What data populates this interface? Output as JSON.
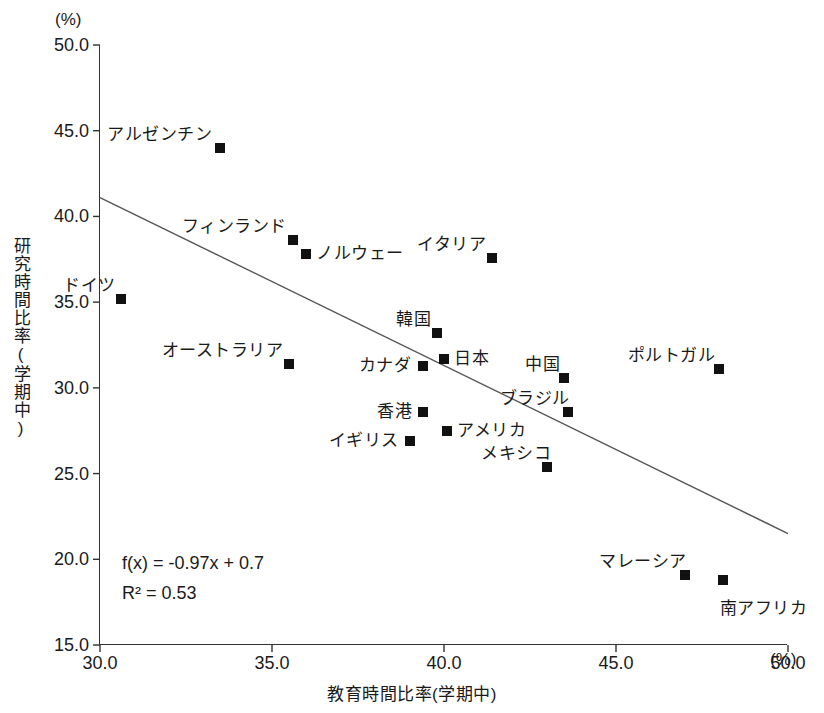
{
  "chart_data": {
    "type": "scatter",
    "title": "",
    "xlabel": "教育時間比率(学期中)",
    "ylabel": "研究時間比率(学期中)",
    "x_unit": "(%)",
    "y_unit": "(%)",
    "xlim": [
      30.0,
      50.0
    ],
    "ylim": [
      15.0,
      50.0
    ],
    "xticks": [
      "30.0",
      "35.0",
      "40.0",
      "45.0",
      "50.0"
    ],
    "xtick_values": [
      30.0,
      35.0,
      40.0,
      45.0,
      50.0
    ],
    "yticks": [
      "50.0",
      "45.0",
      "40.0",
      "35.0",
      "30.0",
      "25.0",
      "20.0",
      "15.0"
    ],
    "ytick_values": [
      50.0,
      45.0,
      40.0,
      35.0,
      30.0,
      25.0,
      20.0,
      15.0
    ],
    "grid": false,
    "legend": "none",
    "marker": "square",
    "marker_color": "#111111",
    "trendline": {
      "equation": "f(x) = -0.97x + 0.7",
      "r_squared": "R² = 0.53",
      "slope": -0.97,
      "intercept": 0.7,
      "x_start": 30.0,
      "y_start": 41.1,
      "x_end": 50.0,
      "y_end": 21.5,
      "color": "#555555"
    },
    "points": [
      {
        "label": "アルゼンチン",
        "x": 33.5,
        "y": 44.0,
        "label_dx": -8,
        "label_dy": -22,
        "label_align": "right"
      },
      {
        "label": "フィンランド",
        "x": 35.6,
        "y": 38.6,
        "label_dx": -6,
        "label_dy": -22,
        "label_align": "right"
      },
      {
        "label": "ノルウェー",
        "x": 36.0,
        "y": 37.8,
        "label_dx": 10,
        "label_dy": -9,
        "label_align": "left"
      },
      {
        "label": "イタリア",
        "x": 41.4,
        "y": 37.6,
        "label_dx": -6,
        "label_dy": -22,
        "label_align": "right"
      },
      {
        "label": "ドイツ",
        "x": 30.6,
        "y": 35.2,
        "label_dx": -5,
        "label_dy": -22,
        "label_align": "right"
      },
      {
        "label": "韓国",
        "x": 39.8,
        "y": 33.2,
        "label_dx": -6,
        "label_dy": -22,
        "label_align": "right"
      },
      {
        "label": "日本",
        "x": 40.0,
        "y": 31.7,
        "label_dx": 10,
        "label_dy": -9,
        "label_align": "left"
      },
      {
        "label": "オーストラリア",
        "x": 35.5,
        "y": 31.4,
        "label_dx": -6,
        "label_dy": -22,
        "label_align": "right"
      },
      {
        "label": "カナダ",
        "x": 39.4,
        "y": 31.3,
        "label_dx": -12,
        "label_dy": -9,
        "label_align": "right"
      },
      {
        "label": "ポルトガル",
        "x": 48.0,
        "y": 31.1,
        "label_dx": -4,
        "label_dy": -22,
        "label_align": "right"
      },
      {
        "label": "中国",
        "x": 43.5,
        "y": 30.6,
        "label_dx": -4,
        "label_dy": -22,
        "label_align": "right"
      },
      {
        "label": "香港",
        "x": 39.4,
        "y": 28.6,
        "label_dx": -11,
        "label_dy": -9,
        "label_align": "right"
      },
      {
        "label": "ブラジル",
        "x": 43.6,
        "y": 28.6,
        "label_dx": 2,
        "label_dy": -22,
        "label_align": "right"
      },
      {
        "label": "アメリカ",
        "x": 40.1,
        "y": 27.5,
        "label_dx": 10,
        "label_dy": -9,
        "label_align": "left"
      },
      {
        "label": "イギリス",
        "x": 39.0,
        "y": 26.9,
        "label_dx": -11,
        "label_dy": -9,
        "label_align": "right"
      },
      {
        "label": "メキシコ",
        "x": 43.0,
        "y": 25.4,
        "label_dx": 4,
        "label_dy": -22,
        "label_align": "right"
      },
      {
        "label": "マレーシア",
        "x": 47.0,
        "y": 19.1,
        "label_dx": 2,
        "label_dy": -22,
        "label_align": "right"
      },
      {
        "label": "南アフリカ",
        "x": 48.1,
        "y": 18.8,
        "label_dx": -3,
        "label_dy": 20,
        "label_align": "left"
      }
    ]
  }
}
